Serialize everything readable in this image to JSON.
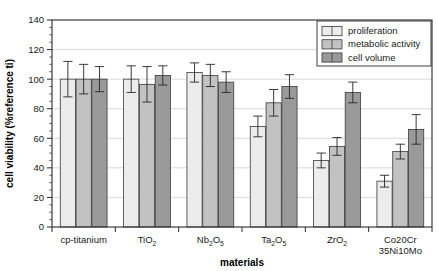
{
  "chart_data": {
    "type": "bar",
    "title": "",
    "xlabel": "materials",
    "ylabel": "cell viability (%reference ti)",
    "ylim": [
      0,
      140
    ],
    "ytick_step": 20,
    "yminor_step": 5,
    "grid": true,
    "legend_position": "top-right",
    "categories": [
      "cp-titanium",
      "TiO2",
      "Nb2O5",
      "Ta2O5",
      "ZrO2",
      "Co20Cr 35Ni10Mo"
    ],
    "category_labels": [
      {
        "main": "cp-titanium",
        "sub": "",
        "line2": "",
        "line2sub": ""
      },
      {
        "main": "TiO",
        "sub": "2",
        "line2": "",
        "line2sub": ""
      },
      {
        "main": "Nb",
        "sub": "2",
        "mid": "O",
        "sub2": "5",
        "line2": "",
        "line2sub": ""
      },
      {
        "main": "Ta",
        "sub": "2",
        "mid": "O",
        "sub2": "5",
        "line2": "",
        "line2sub": ""
      },
      {
        "main": "ZrO",
        "sub": "2",
        "line2": "",
        "line2sub": ""
      },
      {
        "main": "Co20Cr",
        "sub": "",
        "line2": "35Ni10Mo",
        "line2sub": ""
      }
    ],
    "ytick_labels": [
      "0",
      "20",
      "40",
      "60",
      "80",
      "100",
      "120",
      "140"
    ],
    "series": [
      {
        "name": "proliferation",
        "color": "#ececec",
        "values": [
          100,
          100,
          104.5,
          68,
          45,
          31
        ],
        "errors": [
          12,
          9,
          6.5,
          7,
          5,
          4
        ]
      },
      {
        "name": "metabolic activity",
        "color": "#c2c2c2",
        "values": [
          100,
          96.5,
          102.5,
          84,
          54.5,
          51
        ],
        "errors": [
          10,
          12,
          7.5,
          9,
          6,
          5
        ]
      },
      {
        "name": "cell volume",
        "color": "#9a9a9a",
        "values": [
          100,
          102.5,
          98,
          95,
          91,
          66
        ],
        "errors": [
          8.5,
          6.5,
          7,
          8,
          7,
          10
        ]
      }
    ]
  },
  "legend": {
    "entries": [
      "proliferation",
      "metabolic activity",
      "cell volume"
    ]
  },
  "axes": {
    "y_title": "cell viability (%reference ti)",
    "x_title": "materials"
  }
}
